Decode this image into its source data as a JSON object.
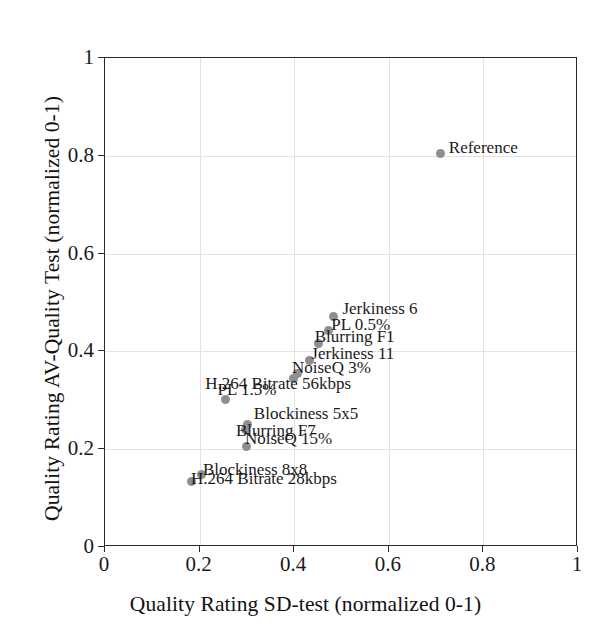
{
  "chart_data": {
    "type": "scatter",
    "title": "",
    "xlabel": "Quality Rating SD-test (normalized 0-1)",
    "ylabel": "Quality Rating AV-Quality Test (normalized 0-1)",
    "xlim": [
      0,
      1
    ],
    "ylim": [
      0,
      1
    ],
    "grid": true,
    "legend": "none",
    "xticks": [
      "0",
      "0.2",
      "0.4",
      "0.6",
      "0.8",
      "1"
    ],
    "xtick_values": [
      0,
      0.2,
      0.4,
      0.6,
      0.8,
      1
    ],
    "yticks": [
      "0",
      "0.2",
      "0.4",
      "0.6",
      "0.8",
      "1"
    ],
    "ytick_values": [
      0,
      0.2,
      0.4,
      0.6,
      0.8,
      1
    ],
    "marker_color": "#8f8f8f",
    "points": [
      {
        "label": "Reference",
        "x": 0.71,
        "y": 0.805,
        "label_dx": 8,
        "label_dy": -14
      },
      {
        "label": "Jerkiness 6",
        "x": 0.483,
        "y": 0.472,
        "label_dx": 9,
        "label_dy": -16
      },
      {
        "label": "PL 0.5%",
        "x": 0.472,
        "y": 0.442,
        "label_dx": 3,
        "label_dy": -15
      },
      {
        "label": "Blurring F1",
        "x": 0.452,
        "y": 0.417,
        "label_dx": -4,
        "label_dy": -15
      },
      {
        "label": "Jerkiness 11",
        "x": 0.432,
        "y": 0.382,
        "label_dx": 2,
        "label_dy": -15
      },
      {
        "label": "NoiseQ 3%",
        "x": 0.408,
        "y": 0.355,
        "label_dx": -6,
        "label_dy": -14
      },
      {
        "label": "H.264 Bitrate 56kbps",
        "x": 0.398,
        "y": 0.345,
        "label_dx": -88,
        "label_dy": -3
      },
      {
        "label": "PL 1.5%",
        "x": 0.255,
        "y": 0.302,
        "label_dx": -8,
        "label_dy": -18
      },
      {
        "label": "Blockiness 5x5",
        "x": 0.302,
        "y": 0.25,
        "label_dx": 6,
        "label_dy": -20
      },
      {
        "label": "Blurring F7",
        "x": 0.298,
        "y": 0.24,
        "label_dx": -10,
        "label_dy": -8
      },
      {
        "label": "NoiseQ 15%",
        "x": 0.3,
        "y": 0.205,
        "label_dx": -2,
        "label_dy": -17
      },
      {
        "label": "Blockiness 8x8",
        "x": 0.203,
        "y": 0.148,
        "label_dx": 2,
        "label_dy": -14
      },
      {
        "label": "H.264 Bitrate 28kbps",
        "x": 0.182,
        "y": 0.133,
        "label_dx": 0,
        "label_dy": -12
      }
    ]
  },
  "axes": {
    "x_title": "Quality Rating SD-test (normalized 0-1)",
    "y_title": "Quality Rating AV-Quality Test (normalized 0-1)"
  }
}
